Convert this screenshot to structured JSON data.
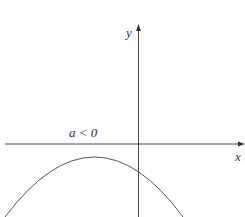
{
  "diagram": {
    "condition_label": "a < 0",
    "x_axis_label": "x",
    "y_axis_label": "y",
    "curve": "downward parabola, vertex below x-axis left of y-axis, no x-intercepts",
    "colors": {
      "axis": "#333333",
      "curve": "#555555"
    }
  }
}
